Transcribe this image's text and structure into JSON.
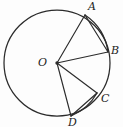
{
  "figure": {
    "kind": "circle-geometry-diagram",
    "background_color": "#fdfdfd",
    "stroke_color": "#2b2b2b",
    "width": 123,
    "height": 127,
    "circle": {
      "center_label": "O",
      "center_x": 57,
      "center_y": 63,
      "radius": 53
    },
    "points": [
      {
        "id": "A",
        "label": "A",
        "x": 85,
        "y": 15,
        "label_x": 88,
        "label_y": 1
      },
      {
        "id": "B",
        "label": "B",
        "x": 108,
        "y": 52,
        "label_x": 111,
        "label_y": 45
      },
      {
        "id": "C",
        "label": "C",
        "x": 97,
        "y": 93,
        "label_x": 101,
        "label_y": 93
      },
      {
        "id": "D",
        "label": "D",
        "x": 71,
        "y": 116,
        "label_x": 68,
        "label_y": 117
      }
    ],
    "center_label_position": {
      "x": 38,
      "y": 57
    },
    "radii": [
      {
        "from": "O",
        "to": "A"
      },
      {
        "from": "O",
        "to": "B"
      },
      {
        "from": "O",
        "to": "C"
      },
      {
        "from": "O",
        "to": "D"
      }
    ],
    "chords": [
      {
        "from": "A",
        "to": "B"
      },
      {
        "from": "D",
        "to": "C"
      }
    ],
    "arcs": [
      {
        "from": "A",
        "to": "B",
        "note": "minor arc AB on circumference"
      },
      {
        "from": "D",
        "to": "C",
        "note": "minor arc DC on circumference"
      }
    ]
  }
}
